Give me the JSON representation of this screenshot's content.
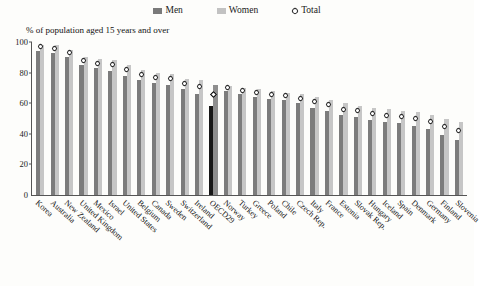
{
  "chart_data": {
    "type": "bar",
    "title": "",
    "subtitle": "",
    "xlabel": "",
    "ylabel": "% of population aged 15 years and over",
    "ylim": [
      0,
      100
    ],
    "yticks": [
      0,
      20,
      40,
      60,
      80,
      100
    ],
    "grid": false,
    "legend_position": "top-center",
    "highlight_category": "OECD29",
    "categories": [
      "Korea",
      "Australia",
      "New Zealand",
      "United Kingdom",
      "Mexico",
      "Israel",
      "United States",
      "Belgium",
      "Canada",
      "Sweden",
      "Switzerland",
      "Ireland",
      "OECD29",
      "Norway",
      "Turkey",
      "Greece",
      "Poland",
      "Chile",
      "Czech Rep.",
      "Italy",
      "France",
      "Estonia",
      "Slovak Rep.",
      "Hungary",
      "Iceland",
      "Spain",
      "Denmark",
      "Germany",
      "Finland",
      "Slovenia"
    ],
    "series": [
      {
        "name": "Men",
        "color": "#7c7c7c",
        "values": [
          94,
          93,
          90,
          85,
          83,
          81,
          78,
          75,
          73,
          72,
          69,
          66,
          58,
          68,
          66,
          64,
          63,
          62,
          60,
          57,
          55,
          52,
          51,
          49,
          48,
          47,
          45,
          43,
          39,
          36
        ]
      },
      {
        "name": "Women",
        "color": "#c6c6c6",
        "values": [
          98,
          98,
          95,
          90,
          89,
          88,
          85,
          82,
          80,
          79,
          76,
          75,
          72,
          71,
          70,
          69,
          68,
          67,
          66,
          64,
          62,
          60,
          58,
          57,
          56,
          55,
          54,
          52,
          50,
          48
        ]
      }
    ],
    "total": {
      "name": "Total",
      "marker": "open-diamond",
      "color": "#2b2b2b",
      "values": [
        97,
        96,
        93,
        88,
        86,
        85,
        82,
        79,
        77,
        76,
        73,
        71,
        66,
        70,
        68,
        67,
        66,
        65,
        63,
        61,
        59,
        56,
        55,
        53,
        52,
        51,
        50,
        48,
        45,
        42
      ]
    },
    "legend": [
      "Men",
      "Women",
      "Total"
    ]
  },
  "legend": {
    "men": "Men",
    "women": "Women",
    "total": "Total"
  },
  "axis": {
    "y_title": "% of population aged 15 years and over"
  }
}
